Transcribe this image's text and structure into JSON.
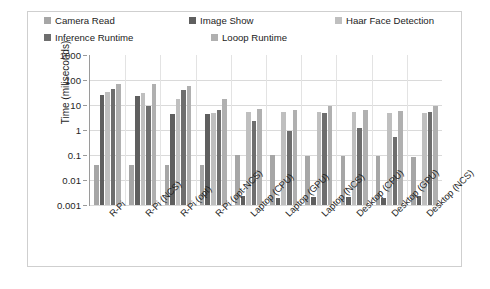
{
  "chart_data": {
    "type": "bar",
    "title": "",
    "subtitle": "",
    "xlabel": "",
    "ylabel": "Time (miliseconds)",
    "yscale": "log",
    "ylim": [
      0.001,
      1000
    ],
    "yticks": [
      "1000",
      "100",
      "10",
      "1",
      "0.1",
      "0.01",
      "0.001"
    ],
    "grid": true,
    "legend_position": "top",
    "categories": [
      "R-Pi",
      "R-Pi (NCS)",
      "R-Pi (opt)",
      "R-Pi (opt-NCS)",
      "Laptop (CPU)",
      "Laptop (GPU)",
      "Laptop (NCS)",
      "Desktop (CPU)",
      "Desktop (GPU)",
      "Desktop (NCS)"
    ],
    "series": [
      {
        "name": "Camera Read",
        "color": "#a6a6a6",
        "values": [
          0.04,
          0.04,
          0.04,
          0.04,
          0.1,
          0.1,
          0.09,
          0.09,
          0.09,
          0.08
        ]
      },
      {
        "name": "Image Show",
        "color": "#5f5f5f",
        "values": [
          25,
          23,
          4.5,
          4.5,
          0.0022,
          0.0019,
          0.0021,
          0.0021,
          0.0019,
          0.0022
        ]
      },
      {
        "name": "Haar Face Detection",
        "color": "#bfbfbf",
        "values": [
          33,
          30,
          17,
          4.8,
          5.5,
          5.2,
          5.5,
          5.2,
          5.0,
          4.8
        ]
      },
      {
        "name": "Inference Runtime",
        "color": "#6e6e6e",
        "values": [
          45,
          9.5,
          40,
          6.5,
          2.2,
          0.95,
          5.0,
          1.2,
          0.55,
          5.5
        ]
      },
      {
        "name": "Looop Runtime",
        "color": "#b0b0b0",
        "values": [
          70,
          70,
          60,
          18,
          7.0,
          6.5,
          9.5,
          6.5,
          5.8,
          9.5
        ]
      }
    ]
  },
  "legend": {
    "items": [
      {
        "label": "Camera Read",
        "color": "#a6a6a6"
      },
      {
        "label": "Image Show",
        "color": "#5f5f5f"
      },
      {
        "label": "Haar Face Detection",
        "color": "#bfbfbf"
      },
      {
        "label": "Inference Runtime",
        "color": "#6e6e6e"
      },
      {
        "label": "Looop Runtime",
        "color": "#b0b0b0"
      }
    ]
  },
  "axis": {
    "y_title": "Time (miliseconds)"
  }
}
